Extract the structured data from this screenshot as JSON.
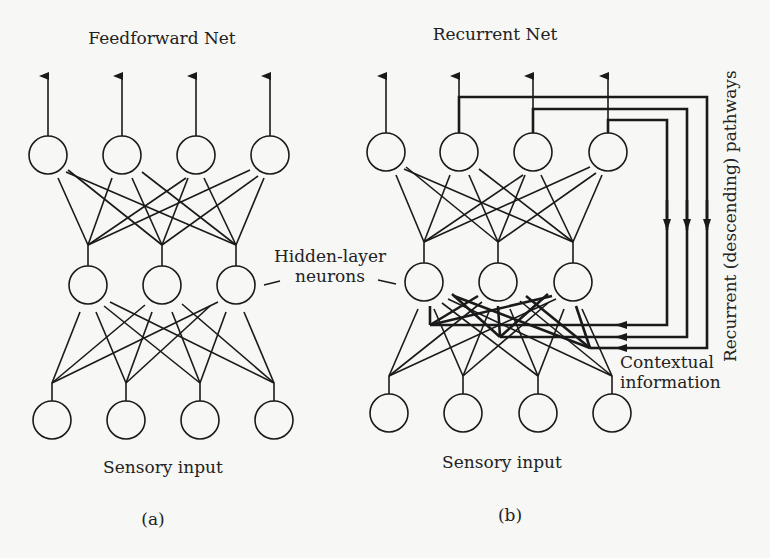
{
  "panels": {
    "a": {
      "title": "Feedforward Net",
      "hidden_label": "Hidden-layer\nneurons",
      "input_label": "Sensory input",
      "caption": "(a)"
    },
    "b": {
      "title": "Recurrent Net",
      "input_label": "Sensory input",
      "context_label_line1": "Contextual",
      "context_label_line2": "information",
      "recurrent_label": "Recurrent (descending) pathways",
      "caption": "(b)"
    }
  },
  "shared": {
    "hidden_label_line1": "Hidden-layer",
    "hidden_label_line2": "neurons"
  },
  "layout": {
    "stroke": "#1a1a1a",
    "background": "#f7f7f5",
    "layers": {
      "output_count": 4,
      "hidden_count": 3,
      "input_count": 4
    }
  }
}
